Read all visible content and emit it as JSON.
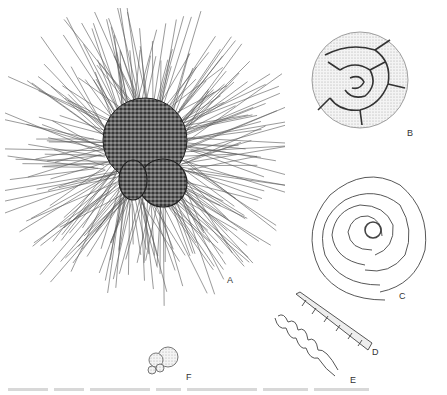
{
  "figure": {
    "specimens": [
      {
        "id": "A",
        "label": "A",
        "description": "spherical test with dense radiating spines"
      },
      {
        "id": "B",
        "label": "B",
        "description": "trochospiral coiled test, stippled"
      },
      {
        "id": "C",
        "label": "C",
        "description": "planispiral multi-chambered coil, outline"
      },
      {
        "id": "D",
        "label": "D",
        "description": "elongate tapering segmented test"
      },
      {
        "id": "E",
        "label": "E",
        "description": "wavy elongate outline test"
      },
      {
        "id": "F",
        "label": "F",
        "description": "small clustered globular chambers"
      }
    ],
    "caption": ""
  },
  "colors": {
    "ink": "#2a2a2a",
    "stipple": "#555555",
    "background": "#ffffff"
  }
}
